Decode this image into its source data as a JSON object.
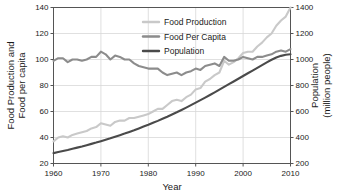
{
  "chart_data": {
    "type": "line",
    "title": "",
    "xlabel": "Year",
    "ylabel": "Food Production and\nFood per capita",
    "ylabel_line1": "Food Production and",
    "ylabel_line2": "Food per capita",
    "y2label_line1": "Population",
    "y2label_line2": "(million people)",
    "xlim": [
      1960,
      2010
    ],
    "ylim": [
      20,
      140
    ],
    "y2lim": [
      200,
      1400
    ],
    "xticks": [
      1960,
      1970,
      1980,
      1990,
      2000,
      2010
    ],
    "xtick_labels": [
      "1960",
      "1970",
      "1980",
      "1990",
      "2000",
      "2010"
    ],
    "yticks": [
      20,
      40,
      60,
      80,
      100,
      120,
      140
    ],
    "ytick_labels": [
      "20",
      "40",
      "60",
      "80",
      "100",
      "120",
      "140"
    ],
    "y2ticks": [
      200,
      400,
      600,
      800,
      1000,
      1200,
      1400
    ],
    "y2tick_labels": [
      "200",
      "400",
      "600",
      "800",
      "1000",
      "1200",
      "1400"
    ],
    "grid": true,
    "legend_position": "top-center",
    "colors": {
      "food_production": "#c9c9c9",
      "food_per_capita": "#8c8c8c",
      "population": "#4a4a4a",
      "axis": "#555555",
      "grid": "#d8d8d8",
      "text": "#1a1a1a"
    },
    "x": [
      1960,
      1961,
      1962,
      1963,
      1964,
      1965,
      1966,
      1967,
      1968,
      1969,
      1970,
      1971,
      1972,
      1973,
      1974,
      1975,
      1976,
      1977,
      1978,
      1979,
      1980,
      1981,
      1982,
      1983,
      1984,
      1985,
      1986,
      1987,
      1988,
      1989,
      1990,
      1991,
      1992,
      1993,
      1994,
      1995,
      1996,
      1997,
      1998,
      1999,
      2000,
      2001,
      2002,
      2003,
      2004,
      2005,
      2006,
      2007,
      2008,
      2009,
      2010
    ],
    "series": [
      {
        "name": "Food Production",
        "axis": "left",
        "color": "#c9c9c9",
        "values": [
          37,
          40,
          41,
          40,
          42,
          43,
          44,
          45,
          47,
          48,
          51,
          50,
          49,
          52,
          53,
          53,
          55,
          55,
          56,
          57,
          58,
          60,
          62,
          62,
          65,
          68,
          69,
          68,
          71,
          73,
          77,
          78,
          83,
          85,
          88,
          90,
          99,
          96,
          98,
          101,
          105,
          106,
          106,
          110,
          113,
          117,
          120,
          126,
          130,
          133,
          140
        ]
      },
      {
        "name": "Food Per Capita",
        "axis": "left",
        "color": "#8c8c8c",
        "values": [
          99,
          101,
          101,
          98,
          100,
          100,
          99,
          100,
          102,
          102,
          106,
          104,
          100,
          103,
          102,
          100,
          100,
          97,
          95,
          94,
          93,
          93,
          93,
          90,
          88,
          89,
          90,
          88,
          90,
          91,
          93,
          92,
          95,
          96,
          97,
          95,
          102,
          99,
          99,
          100,
          102,
          101,
          100,
          102,
          102,
          103,
          104,
          106,
          107,
          106,
          108
        ]
      },
      {
        "name": "Population",
        "axis": "right",
        "color": "#4a4a4a",
        "values": [
          280,
          288,
          296,
          304,
          313,
          322,
          331,
          341,
          351,
          361,
          372,
          383,
          394,
          406,
          418,
          430,
          443,
          456,
          470,
          484,
          498,
          513,
          528,
          544,
          560,
          577,
          594,
          612,
          630,
          649,
          668,
          687,
          707,
          727,
          747,
          768,
          789,
          810,
          831,
          852,
          873,
          894,
          915,
          936,
          957,
          978,
          998,
          1015,
          1028,
          1036,
          1040
        ]
      }
    ]
  },
  "legend": {
    "items": [
      {
        "label": "Food Production",
        "color": "#c9c9c9"
      },
      {
        "label": "Food Per Capita",
        "color": "#8c8c8c"
      },
      {
        "label": "Population",
        "color": "#4a4a4a"
      }
    ]
  }
}
